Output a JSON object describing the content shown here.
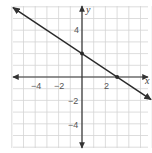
{
  "chart_data": {
    "type": "line",
    "title": "",
    "xlabel": "x",
    "ylabel": "y",
    "xlim": [
      -6,
      6
    ],
    "ylim": [
      -6,
      6
    ],
    "grid": true,
    "x_ticks_labeled": [
      -4,
      -2,
      2
    ],
    "y_ticks_labeled": [
      4,
      -2,
      -4
    ],
    "series": [
      {
        "name": "line",
        "equation": "y = -2/3 x + 2",
        "points": [
          [
            0,
            2
          ],
          [
            3,
            0
          ]
        ],
        "marked_points": [
          [
            0,
            2
          ],
          [
            3,
            0
          ]
        ],
        "arrows_both_ends": true
      }
    ]
  },
  "labels": {
    "x_axis": "x",
    "y_axis": "y",
    "x_ticks": [
      "−4",
      "−2",
      "2"
    ],
    "y_ticks": [
      "4",
      "−2",
      "−4"
    ]
  },
  "colors": {
    "grid": "#d4d4d4",
    "axis": "#333333",
    "line": "#2a2a2a"
  }
}
